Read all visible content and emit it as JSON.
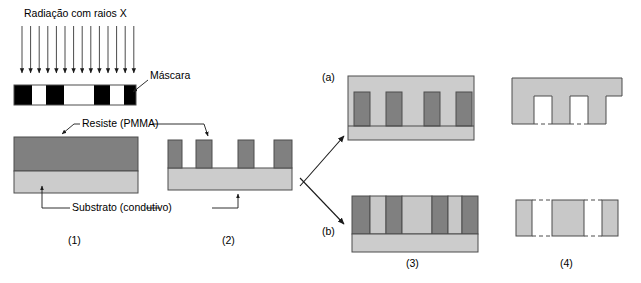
{
  "figure": {
    "title_text": "Radiação com raios X",
    "domain": "x-ray lithography LIGA process diagram",
    "labels": {
      "radiation": "Radiação com raios X",
      "mask": "Máscara",
      "resist": "Resiste (PMMA)",
      "substrate": "Substrato (condutivo)",
      "branch_a": "(a)",
      "branch_b": "(b)",
      "step1": "(1)",
      "step2": "(2)",
      "step3": "(3)",
      "step4": "(4)"
    },
    "colors": {
      "resist_dark_gray": "#808080",
      "substrate_light_gray": "#cccccc",
      "metal_light_gray": "#c8c8c8",
      "mask_absorber": "#000000",
      "mask_transparent": "#ffffff",
      "outline": "#4d4d4d",
      "text": "#000000",
      "arrow": "#1a1a1a",
      "background": "#ffffff"
    },
    "radiation_arrows": {
      "count": 14,
      "x_start": 22,
      "x_step": 8.6,
      "y_top": 26,
      "y_bottom": 75
    },
    "mask": {
      "x": 14,
      "y": 85,
      "width": 122,
      "height": 20,
      "segments": [
        {
          "type": "absorber",
          "width": 18
        },
        {
          "type": "transparent",
          "width": 14
        },
        {
          "type": "absorber",
          "width": 18
        },
        {
          "type": "transparent",
          "width": 30
        },
        {
          "type": "absorber",
          "width": 16
        },
        {
          "type": "transparent",
          "width": 14
        },
        {
          "type": "absorber",
          "width": 12
        }
      ]
    },
    "step1": {
      "x": 14,
      "resist_y": 137,
      "resist_w": 124,
      "resist_h": 34,
      "substrate_y": 171,
      "substrate_h": 22
    },
    "step2": {
      "x": 168,
      "substrate_y": 168,
      "substrate_w": 124,
      "substrate_h": 22,
      "post_y": 140,
      "post_h": 28,
      "posts": [
        {
          "x": 168,
          "w": 14
        },
        {
          "x": 196,
          "w": 16
        },
        {
          "x": 238,
          "w": 16
        },
        {
          "x": 274,
          "w": 18
        }
      ]
    },
    "step3a": {
      "x": 348,
      "y": 76,
      "width": 126,
      "height": 64,
      "metal_top_h": 16,
      "substrate_h": 14,
      "posts": [
        {
          "x": 354,
          "w": 16
        },
        {
          "x": 386,
          "w": 16
        },
        {
          "x": 424,
          "w": 16
        },
        {
          "x": 456,
          "w": 16
        }
      ]
    },
    "step4a": {
      "x": 512,
      "y": 78,
      "width": 110,
      "top_h": 18,
      "leg_h": 28,
      "legs": [
        {
          "x": 512,
          "w": 22
        },
        {
          "x": 552,
          "w": 18
        },
        {
          "x": 588,
          "w": 18
        }
      ]
    },
    "step3b": {
      "x": 352,
      "y": 196,
      "width": 126,
      "stripe_h": 38,
      "substrate_h": 18,
      "stripes": [
        {
          "type": "resist",
          "w": 18
        },
        {
          "type": "metal",
          "w": 16
        },
        {
          "type": "resist",
          "w": 16
        },
        {
          "type": "metal",
          "w": 30
        },
        {
          "type": "resist",
          "w": 16
        },
        {
          "type": "metal",
          "w": 14
        },
        {
          "type": "resist",
          "w": 16
        }
      ]
    },
    "step4b": {
      "y": 200,
      "height": 36,
      "blocks": [
        {
          "x": 516,
          "w": 16
        },
        {
          "x": 552,
          "w": 32
        },
        {
          "x": 602,
          "w": 16
        }
      ]
    }
  }
}
